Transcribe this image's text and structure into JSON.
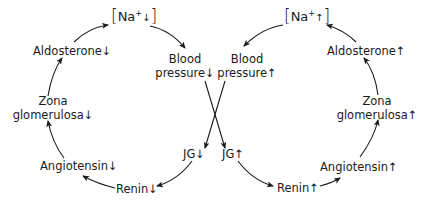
{
  "diagram": {
    "type": "feedback-loops",
    "left_loop": {
      "direction_symbol": "↓",
      "na": {
        "open": "[",
        "base": "Na",
        "charge": "+",
        "arrow": "↓",
        "close": "]"
      },
      "blood_pressure": {
        "line1": "Blood",
        "line2": "pressure↓"
      },
      "jg": "JG↓",
      "renin": "Renin↓",
      "angiotensin": "Angiotensin↓",
      "zona": {
        "line1": "Zona",
        "line2": "glomerulosa↓"
      },
      "aldosterone": "Aldosterone↓"
    },
    "right_loop": {
      "direction_symbol": "↑",
      "na": {
        "open": "[",
        "base": "Na",
        "charge": "+",
        "arrow": "↑",
        "close": "]"
      },
      "blood_pressure": {
        "line1": "Blood",
        "line2": "pressure↑"
      },
      "jg": "JG↑",
      "renin": "Renin↑",
      "angiotensin": "Angiotensin↑",
      "zona": {
        "line1": "Zona",
        "line2": "glomerulosa↑"
      },
      "aldosterone": "Aldosterone↑"
    },
    "edges": [
      {
        "from": "[Na+↓]",
        "to": "Blood pressure↓"
      },
      {
        "from": "Blood pressure↓",
        "to": "JG↑"
      },
      {
        "from": "JG↓",
        "to": "Renin↓"
      },
      {
        "from": "Renin↓",
        "to": "Angiotensin↓"
      },
      {
        "from": "Angiotensin↓",
        "to": "Zona glomerulosa↓"
      },
      {
        "from": "Zona glomerulosa↓",
        "to": "Aldosterone↓"
      },
      {
        "from": "Aldosterone↓",
        "to": "[Na+↓]"
      },
      {
        "from": "[Na+↑]",
        "to": "Blood pressure↑"
      },
      {
        "from": "Blood pressure↑",
        "to": "JG↓"
      },
      {
        "from": "JG↑",
        "to": "Renin↑"
      },
      {
        "from": "Renin↑",
        "to": "Angiotensin↑"
      },
      {
        "from": "Angiotensin↑",
        "to": "Zona glomerulosa↑"
      },
      {
        "from": "Zona glomerulosa↑",
        "to": "Aldosterone↑"
      },
      {
        "from": "Aldosterone↑",
        "to": "[Na+↑]"
      }
    ],
    "colors": {
      "ink": "#1a1a1a",
      "background": "#ffffff"
    }
  }
}
